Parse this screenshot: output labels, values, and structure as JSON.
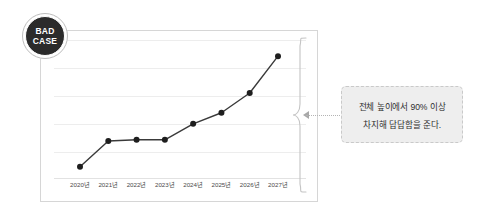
{
  "badge": {
    "line1": "BAD",
    "line2": "CASE"
  },
  "callout": {
    "line1": "전체 높이에서 90% 이상",
    "line2": "차지해 답답함을 준다."
  },
  "colors": {
    "badge_fill": "#2b2b2b",
    "badge_text": "#ffffff",
    "line": "#3a3a3a",
    "marker": "#1e1e1e",
    "frame": "#d6d6d6",
    "grid": "#ededed",
    "callout_bg": "#eeeeee",
    "callout_border": "#c9c9c9",
    "connector": "#b4b4b4",
    "canvas": "#ffffff"
  },
  "chart_data": {
    "type": "line",
    "title": "",
    "subtitle": "",
    "xlabel": "",
    "ylabel": "",
    "grid": true,
    "legend": null,
    "categories": [
      "2020년",
      "2021년",
      "2022년",
      "2023년",
      "2024년",
      "2025년",
      "2026년",
      "2027년"
    ],
    "ylim": [
      0,
      100
    ],
    "series": [
      {
        "name": "값",
        "values": [
          5,
          26,
          27,
          27,
          40,
          49,
          65,
          95
        ]
      }
    ],
    "annotations": [
      {
        "text": "전체 높이에서 90% 이상 차지해 답답함을 준다.",
        "target": "2027년",
        "marker": "brace"
      }
    ]
  }
}
